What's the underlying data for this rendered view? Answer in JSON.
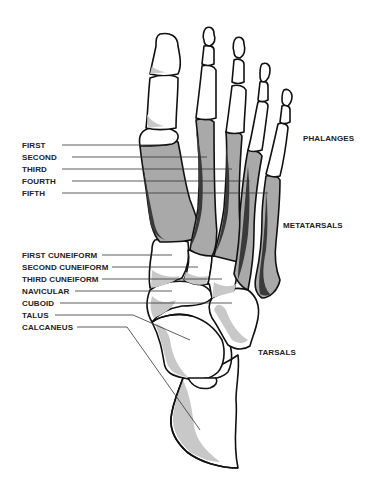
{
  "figure": {
    "metatarsal_labels": [
      {
        "text": "FIRST",
        "x": 22,
        "y": 141,
        "line": [
          62,
          145,
          165,
          145
        ]
      },
      {
        "text": "SECOND",
        "x": 22,
        "y": 153,
        "line": [
          72,
          157,
          207,
          157
        ]
      },
      {
        "text": "THIRD",
        "x": 22,
        "y": 165,
        "line": [
          62,
          169,
          232,
          169
        ]
      },
      {
        "text": "FOURTH",
        "x": 22,
        "y": 177,
        "line": [
          72,
          181,
          250,
          181
        ]
      },
      {
        "text": "FIFTH",
        "x": 22,
        "y": 189,
        "line": [
          62,
          193,
          268,
          193
        ]
      }
    ],
    "tarsal_labels": [
      {
        "text": "FIRST CUNEIFORM",
        "x": 22,
        "y": 251,
        "line": [
          102,
          255,
          172,
          255
        ]
      },
      {
        "text": "SECOND CUNEIFORM",
        "x": 22,
        "y": 263,
        "line": [
          112,
          267,
          198,
          267
        ]
      },
      {
        "text": "THIRD CUNEIFORM",
        "x": 22,
        "y": 275,
        "line": [
          102,
          279,
          222,
          279
        ]
      },
      {
        "text": "NAVICULAR",
        "x": 22,
        "y": 287,
        "line": [
          75,
          291,
          172,
          291
        ]
      },
      {
        "text": "CUBOID",
        "x": 22,
        "y": 299,
        "line": [
          60,
          303,
          232,
          303
        ]
      },
      {
        "text": "TALUS",
        "x": 22,
        "y": 311,
        "line": [
          55,
          315,
          133,
          315,
          190,
          340
        ]
      },
      {
        "text": "CALCANEUS",
        "x": 22,
        "y": 323,
        "line": [
          77,
          327,
          127,
          327,
          200,
          430
        ]
      }
    ],
    "group_labels": [
      {
        "text": "PHALANGES",
        "x": 303,
        "y": 134
      },
      {
        "text": "METATARSALS",
        "x": 283,
        "y": 221
      },
      {
        "text": "TARSALS",
        "x": 258,
        "y": 348
      }
    ]
  }
}
